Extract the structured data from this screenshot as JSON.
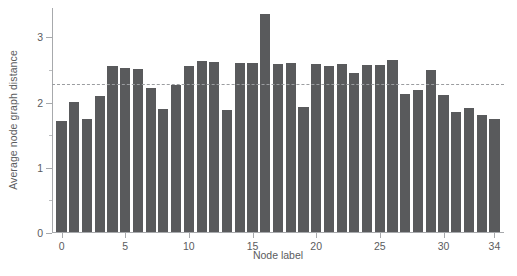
{
  "chart_data": {
    "type": "bar",
    "title": "",
    "xlabel": "Node label",
    "ylabel": "Average node graph distance",
    "categories": [
      0,
      1,
      2,
      3,
      4,
      5,
      6,
      7,
      8,
      9,
      10,
      11,
      12,
      13,
      14,
      15,
      16,
      17,
      18,
      19,
      20,
      21,
      22,
      23,
      24,
      25,
      26,
      27,
      28,
      29,
      30,
      31,
      32,
      33,
      34
    ],
    "values": [
      1.7,
      1.99,
      1.73,
      2.09,
      2.55,
      2.51,
      2.5,
      2.21,
      1.88,
      2.25,
      2.55,
      2.62,
      2.6,
      1.87,
      2.59,
      2.59,
      3.35,
      2.57,
      2.59,
      1.91,
      2.58,
      2.54,
      2.58,
      2.44,
      2.56,
      2.56,
      2.63,
      2.12,
      2.17,
      2.48,
      2.1,
      1.84,
      1.9,
      1.8,
      1.74
    ],
    "xlim": [
      -0.75,
      34.75
    ],
    "ylim": [
      0,
      3.45
    ],
    "ytick_labels": [
      "0",
      "1",
      "2",
      "3"
    ],
    "ytick_values": [
      0,
      1,
      2,
      3
    ],
    "yminor_values": [
      0.5,
      1.5,
      2.5,
      3.5
    ],
    "xtick_labels": [
      "0",
      "5",
      "10",
      "15",
      "20",
      "25",
      "30",
      "34"
    ],
    "xtick_values": [
      0,
      5,
      10,
      15,
      20,
      25,
      30,
      34
    ],
    "grid": false,
    "legend": null,
    "annotations": [
      {
        "name": "mean-reference-line",
        "type": "hline",
        "value": 2.28,
        "style": "dashed",
        "color": "#9b9da0"
      }
    ],
    "bar_color": "#595a5c",
    "axis_color": "#a7a9ac",
    "text_color": "#5b5c5e"
  },
  "caption": {
    "text": ""
  }
}
